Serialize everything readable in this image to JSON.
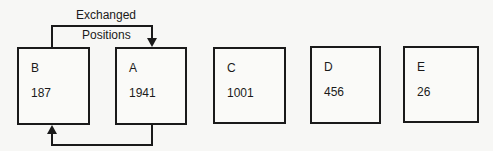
{
  "caption": {
    "line1": "Exchanged",
    "line2": "Positions"
  },
  "boxes": [
    {
      "label": "B",
      "value": "187"
    },
    {
      "label": "A",
      "value": "1941"
    },
    {
      "label": "C",
      "value": "1001"
    },
    {
      "label": "D",
      "value": "456"
    },
    {
      "label": "E",
      "value": "26"
    }
  ],
  "connectors": [
    {
      "from": "B",
      "to": "A",
      "route": "top",
      "arrow": "down-into-A"
    },
    {
      "from": "A",
      "to": "B",
      "route": "bottom",
      "arrow": "up-into-B"
    }
  ],
  "colors": {
    "stroke": "#1a1a1a",
    "background": "#f7f7f5"
  }
}
